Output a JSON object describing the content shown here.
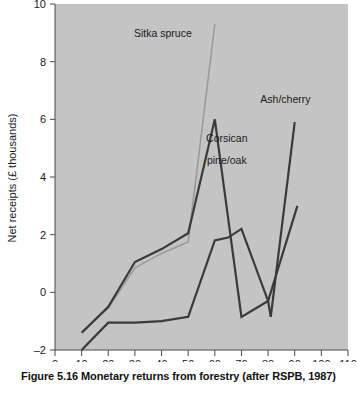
{
  "figure": {
    "caption": "Figure 5.16  Monetary returns from forestry (after RSPB, 1987)"
  },
  "chart_data": {
    "type": "line",
    "title": "",
    "xlabel": "",
    "ylabel": "Net receipts (£ thousands)",
    "xlim": [
      0,
      110
    ],
    "ylim": [
      -2,
      10
    ],
    "xticks": [
      0,
      10,
      20,
      30,
      40,
      50,
      60,
      70,
      80,
      90,
      100,
      110
    ],
    "yticks": [
      -2,
      0,
      2,
      4,
      6,
      8,
      10
    ],
    "grid": false,
    "legend": "inline-annotations",
    "plot_background": "#c4c4c4",
    "page_background": "#ffffff",
    "series": [
      {
        "name": "Sitka spruce",
        "color": "#9a9a9a",
        "x": [
          10,
          20,
          30,
          40,
          50,
          60
        ],
        "values": [
          -1.4,
          -0.55,
          0.85,
          1.35,
          1.75,
          9.3
        ]
      },
      {
        "name": "Corsican pine/oak",
        "color": "#3a3a3a",
        "x": [
          10,
          20,
          30,
          40,
          50,
          60,
          70,
          80,
          91
        ],
        "values": [
          -1.4,
          -0.5,
          1.05,
          1.5,
          2.05,
          6.0,
          -0.85,
          -0.3,
          3.0
        ]
      },
      {
        "name": "Ash/cherry",
        "color": "#3a3a3a",
        "x": [
          10,
          20,
          30,
          40,
          50,
          60,
          65,
          70,
          80,
          81,
          90
        ],
        "values": [
          -2.0,
          -1.05,
          -1.05,
          -1.0,
          -0.85,
          1.8,
          1.9,
          2.2,
          -0.3,
          -0.85,
          5.9
        ]
      }
    ],
    "annotations": [
      {
        "text": "Sitka spruce",
        "x": 40.5,
        "y": 8.85
      },
      {
        "text": "Corsican",
        "x": 64.5,
        "y": 5.2
      },
      {
        "text": "pine/oak",
        "x": 64.5,
        "y": 4.45
      },
      {
        "text": "Ash/cherry",
        "x": 86.5,
        "y": 6.55
      }
    ]
  }
}
